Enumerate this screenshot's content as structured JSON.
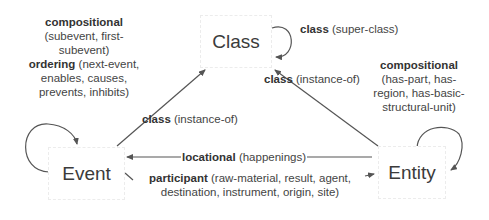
{
  "diagram": {
    "nodes": {
      "class": {
        "label": "Class"
      },
      "event": {
        "label": "Event"
      },
      "entity": {
        "label": "Entity"
      }
    },
    "edges": {
      "class_self": {
        "bold": "class",
        "rest": " (super-class)"
      },
      "event_to_class": {
        "bold": "class",
        "rest": " (instance-of)"
      },
      "entity_to_class": {
        "bold": "class",
        "rest": " (instance-of)"
      },
      "entity_to_event": {
        "bold": "locational",
        "rest": " (happenings)"
      },
      "event_self": {
        "bold1": "compositional",
        "line1": "(subevent, first-",
        "line2": "subevent)",
        "bold2": "ordering",
        "line3": " (next-event,",
        "line4": "enables, causes,",
        "line5": "prevents, inhibits)"
      },
      "entity_self": {
        "bold": "compositional",
        "line1": "(has-part, has-",
        "line2": "region, has-basic-",
        "line3": "structural-unit)"
      },
      "event_to_entity": {
        "bold": "participant",
        "line1": " (raw-material, result, agent,",
        "line2": "destination, instrument, origin, site)"
      }
    },
    "colors": {
      "line": "#555555",
      "text": "#444444"
    }
  }
}
